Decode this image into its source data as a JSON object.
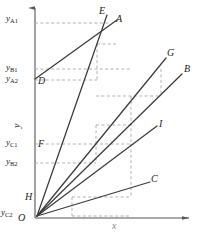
{
  "figure": {
    "type": "geometric-line-diagram",
    "axes": {
      "x_label": "x",
      "y_label": "y",
      "origin_label": "O"
    },
    "axis_value_labels": [
      {
        "id": "yA1",
        "text": "y",
        "sub": "A1",
        "x": 6,
        "y": 14
      },
      {
        "id": "yB1",
        "text": "y",
        "sub": "B1",
        "x": 6,
        "y": 65
      },
      {
        "id": "yA2",
        "text": "y",
        "sub": "A2",
        "x": 6,
        "y": 78
      },
      {
        "id": "yC1",
        "text": "y",
        "sub": "C1",
        "x": 6,
        "y": 139
      },
      {
        "id": "yB2",
        "text": "y",
        "sub": "B2",
        "x": 6,
        "y": 159
      },
      {
        "id": "yC2",
        "text": "y",
        "sub": "C2",
        "x": 2,
        "y": 211
      }
    ],
    "point_labels": [
      {
        "id": "E",
        "text": "E",
        "x": 100,
        "y": 10
      },
      {
        "id": "A",
        "text": "A",
        "x": 115,
        "y": 18
      },
      {
        "id": "G",
        "text": "G",
        "x": 168,
        "y": 52
      },
      {
        "id": "B",
        "text": "B",
        "x": 185,
        "y": 68
      },
      {
        "id": "D",
        "text": "D",
        "x": 38,
        "y": 80
      },
      {
        "id": "I",
        "text": "I",
        "x": 160,
        "y": 123
      },
      {
        "id": "F",
        "text": "F",
        "x": 38,
        "y": 143
      },
      {
        "id": "C",
        "text": "C",
        "x": 152,
        "y": 178
      },
      {
        "id": "H",
        "text": "H",
        "x": 26,
        "y": 196
      }
    ],
    "colors": {
      "line": "#3a3a3a",
      "dashed": "#a8a8a8",
      "axis": "#555555",
      "text": "#1a1a1a",
      "background": "#ffffff"
    },
    "geometry": {
      "axis": {
        "y_axis": {
          "x": 35,
          "y_top": 4,
          "y_bottom": 218
        },
        "x_axis": {
          "y": 218,
          "x_left": 35,
          "x_right": 193
        }
      },
      "solid_lines": [
        {
          "name": "D-to-A",
          "x1": 35,
          "y1": 79,
          "x2": 117,
          "y2": 20
        },
        {
          "name": "H-to-E",
          "x1": 37,
          "y1": 216,
          "x2": 106,
          "y2": 16
        },
        {
          "name": "O-to-G",
          "x1": 37,
          "y1": 216,
          "x2": 166,
          "y2": 58
        },
        {
          "name": "O-to-B",
          "x1": 37,
          "y1": 216,
          "x2": 182,
          "y2": 74
        },
        {
          "name": "O-to-I",
          "x1": 37,
          "y1": 216,
          "x2": 157,
          "y2": 126
        },
        {
          "name": "O-to-C",
          "x1": 37,
          "y1": 216,
          "x2": 150,
          "y2": 182
        }
      ],
      "dashed_lines": [
        {
          "name": "yA1-horizontal",
          "x1": 35,
          "y1": 23,
          "x2": 109,
          "y2": 23
        },
        {
          "name": "yB1-horizontal",
          "x1": 35,
          "y1": 69,
          "x2": 130,
          "y2": 69
        },
        {
          "name": "yA2-horizontal",
          "x1": 35,
          "y1": 80,
          "x2": 97,
          "y2": 80
        },
        {
          "name": "yC1-horizontal",
          "x1": 35,
          "y1": 144,
          "x2": 134,
          "y2": 144
        },
        {
          "name": "yB2-horizontal",
          "x1": 35,
          "y1": 163,
          "x2": 96,
          "y2": 163
        },
        {
          "name": "A-vertical",
          "x1": 97,
          "y1": 44,
          "x2": 97,
          "y2": 80
        },
        {
          "name": "A-top-horizontal",
          "x1": 97,
          "y1": 44,
          "x2": 115,
          "y2": 44
        },
        {
          "name": "G-vertical",
          "x1": 161,
          "y1": 69,
          "x2": 161,
          "y2": 96
        },
        {
          "name": "G-inner-vertical",
          "x1": 131,
          "y1": 96,
          "x2": 131,
          "y2": 144
        },
        {
          "name": "G-inner-horizontal",
          "x1": 96,
          "y1": 96,
          "x2": 161,
          "y2": 96
        },
        {
          "name": "B-vertical",
          "x1": 96,
          "y1": 125,
          "x2": 96,
          "y2": 163
        },
        {
          "name": "B-inner-horizontal",
          "x1": 96,
          "y1": 125,
          "x2": 134,
          "y2": 125
        },
        {
          "name": "I-vertical",
          "x1": 131,
          "y1": 144,
          "x2": 131,
          "y2": 190
        },
        {
          "name": "C-vertical",
          "x1": 72,
          "y1": 197,
          "x2": 72,
          "y2": 216
        },
        {
          "name": "C-horizontal",
          "x1": 72,
          "y1": 197,
          "x2": 131,
          "y2": 197
        },
        {
          "name": "I-horizontal-lower",
          "x1": 72,
          "y1": 216,
          "x2": 131,
          "y2": 216
        }
      ]
    }
  }
}
